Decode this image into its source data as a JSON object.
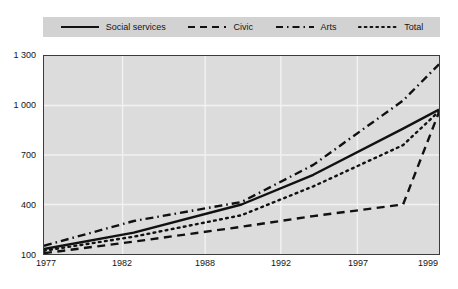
{
  "legend": {
    "position": "top",
    "entries": [
      {
        "label": "Social services",
        "style": "solid",
        "swatch": "line-solid-swatch"
      },
      {
        "label": "Civic",
        "style": "dashed",
        "swatch": "line-dashed-swatch"
      },
      {
        "label": "Arts",
        "style": "dashdot",
        "swatch": "line-dashdot-swatch"
      },
      {
        "label": "Total",
        "style": "dotted",
        "swatch": "line-dotted-swatch"
      }
    ]
  },
  "axes": {
    "y_tick_labels": [
      "1 300",
      "1 000",
      "700",
      "400",
      "100"
    ],
    "x_tick_labels": [
      "1977",
      "1982",
      "1988",
      "1992",
      "1997",
      "1999"
    ]
  },
  "colors": {
    "plot_background": "#dcdcdc",
    "legend_background": "#d2d2d2",
    "gridline": "#f2f2f2",
    "frame": "#3c3c3c",
    "series": "#111111",
    "page_background": "#ffffff"
  },
  "chart_data": {
    "type": "line",
    "title": "",
    "subtitle": "",
    "xlabel": "",
    "ylabel": "",
    "x": [
      1977,
      1982,
      1988,
      1992,
      1997,
      1999
    ],
    "xlim": [
      1977,
      1999
    ],
    "ylim": [
      100,
      1300
    ],
    "yticks": [
      100,
      400,
      700,
      1000,
      1300
    ],
    "xticks": [
      1977,
      1982,
      1988,
      1992,
      1997,
      1999
    ],
    "grid": true,
    "grid_axis": "both",
    "legend_position": "top",
    "series": [
      {
        "name": "Social services",
        "style": "solid",
        "values": [
          130,
          230,
          400,
          580,
          860,
          975
        ]
      },
      {
        "name": "Civic",
        "style": "dashed",
        "values": [
          105,
          175,
          265,
          330,
          400,
          960
        ]
      },
      {
        "name": "Arts",
        "style": "dashdot",
        "values": [
          150,
          300,
          415,
          640,
          1030,
          1250
        ]
      },
      {
        "name": "Total",
        "style": "dotted",
        "values": [
          120,
          205,
          335,
          510,
          760,
          965
        ]
      }
    ]
  }
}
